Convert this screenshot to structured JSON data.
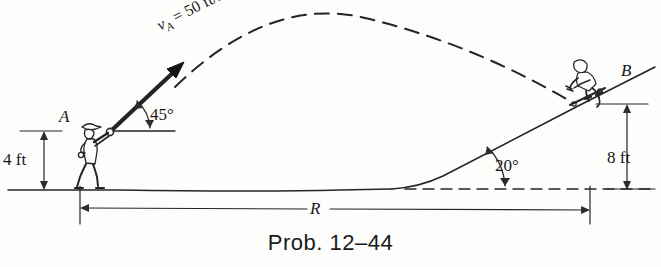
{
  "figure": {
    "caption": "Prob. 12–44",
    "labels": {
      "point_a": "A",
      "point_b": "B",
      "height_a": "4 ft",
      "height_b": "8 ft",
      "launch_angle": "45°",
      "incline_angle": "20°",
      "range": "R",
      "velocity_symbol": "v",
      "velocity_subscript": "A",
      "velocity_value": "= 50 ft/sec",
      "velocity_full": "v_A = 50 ft/sec"
    },
    "values": {
      "initial_speed": 50,
      "speed_units": "ft/sec",
      "launch_angle_deg": 45,
      "incline_angle_deg": 20,
      "height_at_a_ft": 4,
      "height_at_b_ft": 8,
      "range_symbol": "R"
    },
    "colors": {
      "ink": "#2b2b30",
      "paper": "#fdfdfb",
      "text": "#17171a"
    },
    "elements": {
      "trajectory_style": "dashed",
      "ground_style": "solid",
      "datum_style": "dashed",
      "launcher_figure": "person-throwing",
      "landing_figure": "skateboarder"
    }
  }
}
